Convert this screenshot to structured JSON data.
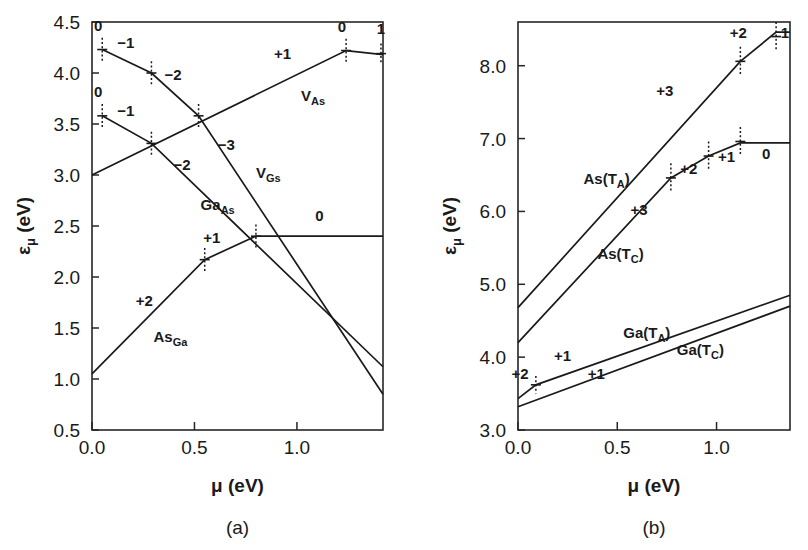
{
  "figure": {
    "background": "#ffffff",
    "ink": "#1a1a1a",
    "width": 808,
    "height": 550
  },
  "panels": [
    {
      "id": "a",
      "caption": "(a)",
      "xlabel_parts": {
        "symbol": "μ",
        "unit": " (eV)"
      },
      "ylabel_parts": {
        "symbol": "ε",
        "subscript": "μ",
        "unit": " (eV)"
      },
      "xticks": [
        "0.0",
        "0.5",
        "1.0"
      ],
      "yticks": [
        "0.5",
        "1.0",
        "1.5",
        "2.0",
        "2.5",
        "3.0",
        "3.5",
        "4.0",
        "4.5"
      ]
    },
    {
      "id": "b",
      "caption": "(b)",
      "xlabel_parts": {
        "symbol": "μ",
        "unit": " (eV)"
      },
      "ylabel_parts": {
        "symbol": "ε",
        "subscript": "μ",
        "unit": " (eV)"
      },
      "xticks": [
        "0.0",
        "0.5",
        "1.0"
      ],
      "yticks": [
        "3.0",
        "4.0",
        "5.0",
        "6.0",
        "7.0",
        "8.0"
      ]
    }
  ],
  "chart_data": [
    {
      "type": "line",
      "panel": "a",
      "title": "(a)",
      "xlabel": "μ (eV)",
      "ylabel": "ε_μ (eV)",
      "xlim": [
        0.0,
        1.42
      ],
      "ylim": [
        0.5,
        4.5
      ],
      "xticks": [
        0.0,
        0.5,
        1.0
      ],
      "yticks": [
        0.5,
        1.0,
        1.5,
        2.0,
        2.5,
        3.0,
        3.5,
        4.0,
        4.5
      ],
      "grid": false,
      "legend": "inline-annotations",
      "series": [
        {
          "name": "V_As",
          "label_text": "V",
          "label_sub": "As",
          "label_x": 1.02,
          "label_y": 3.73,
          "points": [
            [
              0.0,
              3.0
            ],
            [
              1.24,
              4.22
            ],
            [
              1.42,
              4.18
            ]
          ],
          "charge_labels": [
            {
              "text": "+1",
              "x": 0.93,
              "y": 4.14
            },
            {
              "text": "0",
              "x": 1.22,
              "y": 4.4
            },
            {
              "text": "1",
              "x": 1.41,
              "y": 4.38
            }
          ],
          "error_bars": [
            {
              "x": 1.24,
              "y": 4.22,
              "err": 0.115
            },
            {
              "x": 1.41,
              "y": 4.19,
              "err": 0.1
            }
          ]
        },
        {
          "name": "V_Ga",
          "label_text": "V",
          "label_sub": "Gs",
          "label_x": 0.8,
          "label_y": 2.97,
          "points": [
            [
              0.05,
              4.23
            ],
            [
              0.29,
              4.0
            ],
            [
              0.52,
              3.58
            ],
            [
              1.42,
              0.85
            ]
          ],
          "charge_labels": [
            {
              "text": "0",
              "x": 0.03,
              "y": 4.41
            },
            {
              "text": "−1",
              "x": 0.165,
              "y": 4.25
            },
            {
              "text": "−2",
              "x": 0.395,
              "y": 3.93
            },
            {
              "text": "−3",
              "x": 0.655,
              "y": 3.25
            }
          ],
          "error_bars": [
            {
              "x": 0.05,
              "y": 4.23,
              "err": 0.115
            },
            {
              "x": 0.29,
              "y": 4.0,
              "err": 0.115
            },
            {
              "x": 0.52,
              "y": 3.58,
              "err": 0.115
            }
          ]
        },
        {
          "name": "Ga_As",
          "label_text": "Ga",
          "label_sub": "As",
          "label_x": 0.53,
          "label_y": 2.66,
          "points": [
            [
              0.05,
              3.58
            ],
            [
              0.29,
              3.31
            ],
            [
              1.42,
              1.12
            ]
          ],
          "charge_labels": [
            {
              "text": "0",
              "x": 0.03,
              "y": 3.76
            },
            {
              "text": "−1",
              "x": 0.165,
              "y": 3.58
            },
            {
              "text": "−2",
              "x": 0.44,
              "y": 3.05
            }
          ],
          "error_bars": [
            {
              "x": 0.05,
              "y": 3.58,
              "err": 0.115
            },
            {
              "x": 0.29,
              "y": 3.31,
              "err": 0.115
            }
          ]
        },
        {
          "name": "As_Ga",
          "label_text": "As",
          "label_sub": "Ga",
          "label_x": 0.3,
          "label_y": 1.36,
          "points": [
            [
              0.0,
              1.05
            ],
            [
              0.55,
              2.17
            ],
            [
              0.8,
              2.4
            ],
            [
              1.42,
              2.4
            ]
          ],
          "charge_labels": [
            {
              "text": "+2",
              "x": 0.255,
              "y": 1.72
            },
            {
              "text": "+1",
              "x": 0.585,
              "y": 2.33
            },
            {
              "text": "0",
              "x": 1.11,
              "y": 2.55
            }
          ],
          "error_bars": [
            {
              "x": 0.55,
              "y": 2.17,
              "err": 0.115
            },
            {
              "x": 0.8,
              "y": 2.4,
              "err": 0.115
            }
          ]
        }
      ]
    },
    {
      "type": "line",
      "panel": "b",
      "title": "(b)",
      "xlabel": "μ (eV)",
      "ylabel": "ε_μ (eV)",
      "xlim": [
        0.0,
        1.37
      ],
      "ylim": [
        3.0,
        8.6
      ],
      "xticks": [
        0.0,
        0.5,
        1.0
      ],
      "yticks": [
        3.0,
        4.0,
        5.0,
        6.0,
        7.0,
        8.0
      ],
      "grid": false,
      "legend": "inline-annotations",
      "series": [
        {
          "name": "As(T_A)",
          "label_text": "As(T",
          "label_sub": "A",
          "label_tail": ")",
          "label_x": 0.33,
          "label_y": 6.38,
          "points": [
            [
              0.0,
              4.68
            ],
            [
              1.12,
              8.06
            ],
            [
              1.3,
              8.46
            ],
            [
              1.37,
              8.46
            ]
          ],
          "charge_labels": [
            {
              "text": "+3",
              "x": 0.74,
              "y": 7.58
            },
            {
              "text": "+2",
              "x": 1.11,
              "y": 8.38
            },
            {
              "text": "1",
              "x": 1.345,
              "y": 8.38
            }
          ],
          "error_bars": [
            {
              "x": 1.12,
              "y": 8.06,
              "err": 0.2
            },
            {
              "x": 1.3,
              "y": 8.4,
              "err": 0.2
            }
          ]
        },
        {
          "name": "As(T_C)",
          "label_text": "As(T",
          "label_sub": "C",
          "label_tail": ")",
          "label_x": 0.4,
          "label_y": 5.35,
          "points": [
            [
              0.0,
              4.2
            ],
            [
              0.77,
              6.46
            ],
            [
              0.96,
              6.76
            ],
            [
              1.12,
              6.94
            ],
            [
              1.37,
              6.94
            ]
          ],
          "charge_labels": [
            {
              "text": "+3",
              "x": 0.61,
              "y": 5.95
            },
            {
              "text": "+2",
              "x": 0.86,
              "y": 6.52
            },
            {
              "text": "+1",
              "x": 1.05,
              "y": 6.68
            },
            {
              "text": "0",
              "x": 1.25,
              "y": 6.72
            }
          ],
          "error_bars": [
            {
              "x": 0.77,
              "y": 6.46,
              "err": 0.2
            },
            {
              "x": 0.96,
              "y": 6.76,
              "err": 0.2
            },
            {
              "x": 1.12,
              "y": 6.96,
              "err": 0.2
            }
          ]
        },
        {
          "name": "Ga(T_A)",
          "label_text": "Ga(T",
          "label_sub": "A",
          "label_tail": ")",
          "label_x": 0.53,
          "label_y": 4.26,
          "points": [
            [
              0.0,
              3.43
            ],
            [
              0.09,
              3.62
            ],
            [
              1.37,
              4.85
            ]
          ],
          "charge_labels": [
            {
              "text": "+2",
              "x": 0.01,
              "y": 3.7
            },
            {
              "text": "+1",
              "x": 0.225,
              "y": 3.95
            }
          ],
          "error_bars": [
            {
              "x": 0.09,
              "y": 3.62,
              "err": 0.12
            }
          ]
        },
        {
          "name": "Ga(T_C)",
          "label_text": "Ga(T",
          "label_sub": "C",
          "label_tail": ")",
          "label_x": 0.8,
          "label_y": 4.03,
          "points": [
            [
              0.0,
              3.32
            ],
            [
              1.37,
              4.7
            ]
          ],
          "charge_labels": [
            {
              "text": "+1",
              "x": 0.395,
              "y": 3.7
            }
          ],
          "error_bars": []
        }
      ]
    }
  ]
}
